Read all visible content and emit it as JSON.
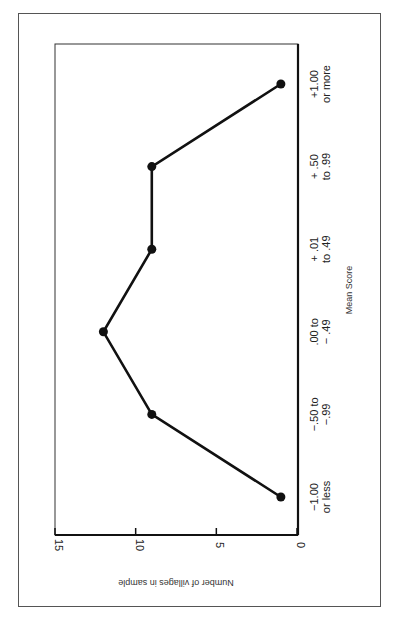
{
  "chart_data": {
    "type": "line",
    "orientation": "rotated-90-clockwise",
    "title": "",
    "xlabel": "Mean Score",
    "ylabel": "Number of villages in sample",
    "categories": [
      [
        "−1.00",
        "or less"
      ],
      [
        "−.50 to",
        "−.99"
      ],
      [
        ".00 to",
        "− .49"
      ],
      [
        "+ .01",
        "to .49"
      ],
      [
        "+ .50",
        "to .99"
      ],
      [
        "+1.00",
        "or more"
      ]
    ],
    "values": [
      1,
      9,
      12,
      9,
      9,
      1
    ],
    "ylim": [
      0,
      15
    ],
    "yticks": [
      "0",
      "5",
      "10",
      "15"
    ],
    "ytick_values": [
      0,
      5,
      10,
      15
    ],
    "grid": false,
    "legend": "none",
    "marker": "filled-circle",
    "color": "#111111"
  }
}
